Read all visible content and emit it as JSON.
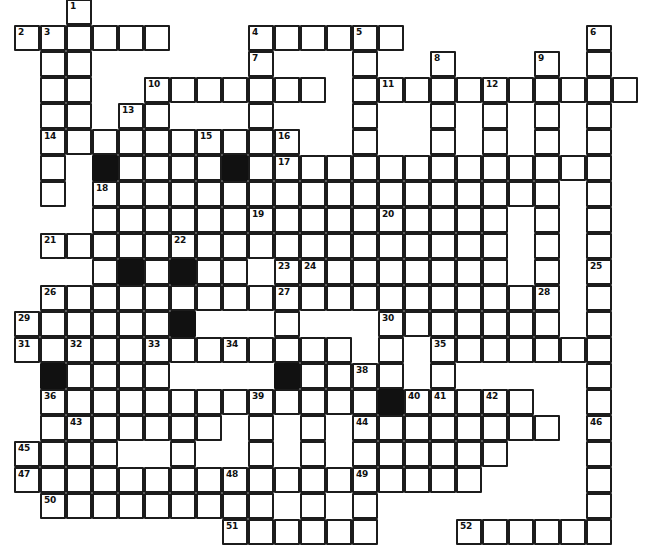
{
  "puzzle": {
    "title": "Crossword Puzzle Grid",
    "kind": "blank-crossword-grid",
    "style": "hand-drawn",
    "colors": {
      "paper": "#ffffff",
      "ink": "#1c1c1c",
      "block": "#111111",
      "number": "#101010"
    },
    "geometry": {
      "image_width": 645,
      "image_height": 530,
      "cell_size": 26,
      "origin_x": 14,
      "origin_y": -1,
      "columns": 24,
      "rows": 20
    },
    "counts": {
      "numbered_clues": 52,
      "blocked_cells": 9
    },
    "numbers": [
      1,
      2,
      3,
      4,
      5,
      6,
      7,
      8,
      9,
      10,
      11,
      12,
      13,
      14,
      15,
      16,
      17,
      18,
      19,
      20,
      21,
      22,
      23,
      24,
      25,
      26,
      27,
      28,
      29,
      30,
      31,
      32,
      33,
      34,
      35,
      36,
      37,
      38,
      39,
      40,
      41,
      42,
      43,
      44,
      45,
      46,
      47,
      48,
      49,
      50,
      51,
      52
    ],
    "cells": [
      {
        "c": 2,
        "r": 0,
        "n": "1"
      },
      {
        "c": 2,
        "r": 1
      },
      {
        "c": 0,
        "r": 1,
        "n": "2"
      },
      {
        "c": 1,
        "r": 1,
        "n": "3"
      },
      {
        "c": 3,
        "r": 1
      },
      {
        "c": 4,
        "r": 1
      },
      {
        "c": 5,
        "r": 1
      },
      {
        "c": 9,
        "r": 1,
        "n": "4"
      },
      {
        "c": 10,
        "r": 1
      },
      {
        "c": 11,
        "r": 1
      },
      {
        "c": 12,
        "r": 1
      },
      {
        "c": 13,
        "r": 1,
        "n": "5"
      },
      {
        "c": 14,
        "r": 1
      },
      {
        "c": 22,
        "r": 1,
        "n": "6"
      },
      {
        "c": 1,
        "r": 2
      },
      {
        "c": 2,
        "r": 2
      },
      {
        "c": 9,
        "r": 2,
        "n": "7"
      },
      {
        "c": 13,
        "r": 2
      },
      {
        "c": 16,
        "r": 2,
        "n": "8"
      },
      {
        "c": 20,
        "r": 2,
        "n": "9"
      },
      {
        "c": 22,
        "r": 2
      },
      {
        "c": 1,
        "r": 3
      },
      {
        "c": 2,
        "r": 3
      },
      {
        "c": 5,
        "r": 3,
        "n": "10"
      },
      {
        "c": 6,
        "r": 3
      },
      {
        "c": 7,
        "r": 3
      },
      {
        "c": 8,
        "r": 3
      },
      {
        "c": 9,
        "r": 3
      },
      {
        "c": 10,
        "r": 3
      },
      {
        "c": 11,
        "r": 3
      },
      {
        "c": 13,
        "r": 3
      },
      {
        "c": 14,
        "r": 3,
        "n": "11"
      },
      {
        "c": 15,
        "r": 3
      },
      {
        "c": 16,
        "r": 3
      },
      {
        "c": 17,
        "r": 3
      },
      {
        "c": 18,
        "r": 3,
        "n": "12"
      },
      {
        "c": 19,
        "r": 3
      },
      {
        "c": 20,
        "r": 3
      },
      {
        "c": 21,
        "r": 3
      },
      {
        "c": 22,
        "r": 3
      },
      {
        "c": 23,
        "r": 3
      },
      {
        "c": 1,
        "r": 4
      },
      {
        "c": 2,
        "r": 4
      },
      {
        "c": 4,
        "r": 4,
        "n": "13"
      },
      {
        "c": 5,
        "r": 4
      },
      {
        "c": 9,
        "r": 4
      },
      {
        "c": 13,
        "r": 4
      },
      {
        "c": 16,
        "r": 4
      },
      {
        "c": 18,
        "r": 4
      },
      {
        "c": 20,
        "r": 4
      },
      {
        "c": 22,
        "r": 4
      },
      {
        "c": 1,
        "r": 5,
        "n": "14"
      },
      {
        "c": 2,
        "r": 5
      },
      {
        "c": 3,
        "r": 5
      },
      {
        "c": 4,
        "r": 5
      },
      {
        "c": 5,
        "r": 5
      },
      {
        "c": 6,
        "r": 5
      },
      {
        "c": 7,
        "r": 5,
        "n": "15"
      },
      {
        "c": 8,
        "r": 5
      },
      {
        "c": 9,
        "r": 5
      },
      {
        "c": 10,
        "r": 5,
        "n": "16"
      },
      {
        "c": 13,
        "r": 5
      },
      {
        "c": 16,
        "r": 5
      },
      {
        "c": 18,
        "r": 5
      },
      {
        "c": 20,
        "r": 5
      },
      {
        "c": 22,
        "r": 5
      },
      {
        "c": 1,
        "r": 6
      },
      {
        "c": 3,
        "r": 6,
        "black": true
      },
      {
        "c": 4,
        "r": 6
      },
      {
        "c": 5,
        "r": 6
      },
      {
        "c": 6,
        "r": 6
      },
      {
        "c": 7,
        "r": 6
      },
      {
        "c": 8,
        "r": 6,
        "black": true
      },
      {
        "c": 9,
        "r": 6
      },
      {
        "c": 10,
        "r": 6,
        "n": "17"
      },
      {
        "c": 11,
        "r": 6
      },
      {
        "c": 12,
        "r": 6
      },
      {
        "c": 13,
        "r": 6
      },
      {
        "c": 14,
        "r": 6
      },
      {
        "c": 15,
        "r": 6
      },
      {
        "c": 16,
        "r": 6
      },
      {
        "c": 17,
        "r": 6
      },
      {
        "c": 18,
        "r": 6
      },
      {
        "c": 19,
        "r": 6
      },
      {
        "c": 20,
        "r": 6
      },
      {
        "c": 21,
        "r": 6
      },
      {
        "c": 22,
        "r": 6
      },
      {
        "c": 1,
        "r": 7
      },
      {
        "c": 3,
        "r": 7,
        "n": "18"
      },
      {
        "c": 4,
        "r": 7
      },
      {
        "c": 5,
        "r": 7
      },
      {
        "c": 6,
        "r": 7
      },
      {
        "c": 7,
        "r": 7
      },
      {
        "c": 8,
        "r": 7
      },
      {
        "c": 9,
        "r": 7
      },
      {
        "c": 10,
        "r": 7
      },
      {
        "c": 11,
        "r": 7
      },
      {
        "c": 12,
        "r": 7
      },
      {
        "c": 13,
        "r": 7
      },
      {
        "c": 14,
        "r": 7
      },
      {
        "c": 15,
        "r": 7
      },
      {
        "c": 16,
        "r": 7
      },
      {
        "c": 17,
        "r": 7
      },
      {
        "c": 18,
        "r": 7
      },
      {
        "c": 19,
        "r": 7
      },
      {
        "c": 20,
        "r": 7
      },
      {
        "c": 22,
        "r": 7
      },
      {
        "c": 3,
        "r": 8
      },
      {
        "c": 4,
        "r": 8
      },
      {
        "c": 5,
        "r": 8
      },
      {
        "c": 6,
        "r": 8
      },
      {
        "c": 7,
        "r": 8
      },
      {
        "c": 8,
        "r": 8
      },
      {
        "c": 9,
        "r": 8,
        "n": "19"
      },
      {
        "c": 10,
        "r": 8
      },
      {
        "c": 11,
        "r": 8
      },
      {
        "c": 12,
        "r": 8
      },
      {
        "c": 13,
        "r": 8
      },
      {
        "c": 14,
        "r": 8,
        "n": "20"
      },
      {
        "c": 15,
        "r": 8
      },
      {
        "c": 16,
        "r": 8
      },
      {
        "c": 17,
        "r": 8
      },
      {
        "c": 18,
        "r": 8
      },
      {
        "c": 20,
        "r": 8
      },
      {
        "c": 22,
        "r": 8
      },
      {
        "c": 1,
        "r": 9,
        "n": "21"
      },
      {
        "c": 2,
        "r": 9
      },
      {
        "c": 3,
        "r": 9
      },
      {
        "c": 4,
        "r": 9
      },
      {
        "c": 5,
        "r": 9
      },
      {
        "c": 6,
        "r": 9,
        "n": "22"
      },
      {
        "c": 7,
        "r": 9
      },
      {
        "c": 8,
        "r": 9
      },
      {
        "c": 9,
        "r": 9
      },
      {
        "c": 10,
        "r": 9
      },
      {
        "c": 11,
        "r": 9
      },
      {
        "c": 12,
        "r": 9
      },
      {
        "c": 13,
        "r": 9
      },
      {
        "c": 14,
        "r": 9
      },
      {
        "c": 15,
        "r": 9
      },
      {
        "c": 16,
        "r": 9
      },
      {
        "c": 17,
        "r": 9
      },
      {
        "c": 18,
        "r": 9
      },
      {
        "c": 20,
        "r": 9
      },
      {
        "c": 22,
        "r": 9
      },
      {
        "c": 3,
        "r": 10
      },
      {
        "c": 4,
        "r": 10,
        "black": true
      },
      {
        "c": 5,
        "r": 10
      },
      {
        "c": 6,
        "r": 10,
        "black": true
      },
      {
        "c": 7,
        "r": 10
      },
      {
        "c": 8,
        "r": 10
      },
      {
        "c": 10,
        "r": 10,
        "n": "23"
      },
      {
        "c": 11,
        "r": 10,
        "n": "24"
      },
      {
        "c": 12,
        "r": 10
      },
      {
        "c": 13,
        "r": 10
      },
      {
        "c": 14,
        "r": 10
      },
      {
        "c": 15,
        "r": 10
      },
      {
        "c": 16,
        "r": 10
      },
      {
        "c": 17,
        "r": 10
      },
      {
        "c": 18,
        "r": 10
      },
      {
        "c": 20,
        "r": 10
      },
      {
        "c": 22,
        "r": 10,
        "n": "25"
      },
      {
        "c": 1,
        "r": 11,
        "n": "26"
      },
      {
        "c": 2,
        "r": 11
      },
      {
        "c": 3,
        "r": 11
      },
      {
        "c": 4,
        "r": 11
      },
      {
        "c": 5,
        "r": 11
      },
      {
        "c": 6,
        "r": 11
      },
      {
        "c": 7,
        "r": 11
      },
      {
        "c": 8,
        "r": 11
      },
      {
        "c": 9,
        "r": 11
      },
      {
        "c": 10,
        "r": 11,
        "n": "27"
      },
      {
        "c": 11,
        "r": 11
      },
      {
        "c": 12,
        "r": 11
      },
      {
        "c": 13,
        "r": 11
      },
      {
        "c": 14,
        "r": 11
      },
      {
        "c": 15,
        "r": 11
      },
      {
        "c": 16,
        "r": 11
      },
      {
        "c": 17,
        "r": 11
      },
      {
        "c": 18,
        "r": 11
      },
      {
        "c": 19,
        "r": 11
      },
      {
        "c": 20,
        "r": 11,
        "n": "28"
      },
      {
        "c": 22,
        "r": 11
      },
      {
        "c": 0,
        "r": 12,
        "n": "29"
      },
      {
        "c": 1,
        "r": 12
      },
      {
        "c": 2,
        "r": 12
      },
      {
        "c": 3,
        "r": 12
      },
      {
        "c": 4,
        "r": 12
      },
      {
        "c": 5,
        "r": 12
      },
      {
        "c": 6,
        "r": 12,
        "black": true
      },
      {
        "c": 10,
        "r": 12
      },
      {
        "c": 14,
        "r": 12,
        "n": "30"
      },
      {
        "c": 15,
        "r": 12
      },
      {
        "c": 16,
        "r": 12
      },
      {
        "c": 17,
        "r": 12
      },
      {
        "c": 18,
        "r": 12
      },
      {
        "c": 19,
        "r": 12
      },
      {
        "c": 20,
        "r": 12
      },
      {
        "c": 22,
        "r": 12
      },
      {
        "c": 0,
        "r": 13,
        "n": "31"
      },
      {
        "c": 1,
        "r": 13
      },
      {
        "c": 2,
        "r": 13,
        "n": "32"
      },
      {
        "c": 3,
        "r": 13
      },
      {
        "c": 4,
        "r": 13
      },
      {
        "c": 5,
        "r": 13,
        "n": "33"
      },
      {
        "c": 6,
        "r": 13
      },
      {
        "c": 7,
        "r": 13
      },
      {
        "c": 8,
        "r": 13,
        "n": "34"
      },
      {
        "c": 9,
        "r": 13
      },
      {
        "c": 10,
        "r": 13
      },
      {
        "c": 11,
        "r": 13
      },
      {
        "c": 12,
        "r": 13
      },
      {
        "c": 14,
        "r": 13
      },
      {
        "c": 16,
        "r": 13,
        "n": "35"
      },
      {
        "c": 17,
        "r": 13
      },
      {
        "c": 18,
        "r": 13
      },
      {
        "c": 19,
        "r": 13
      },
      {
        "c": 20,
        "r": 13
      },
      {
        "c": 21,
        "r": 13
      },
      {
        "c": 22,
        "r": 13
      },
      {
        "c": 1,
        "r": 14,
        "black": true
      },
      {
        "c": 2,
        "r": 14
      },
      {
        "c": 3,
        "r": 14
      },
      {
        "c": 4,
        "r": 14
      },
      {
        "c": 5,
        "r": 14
      },
      {
        "c": 10,
        "r": 14,
        "black": true
      },
      {
        "c": 11,
        "r": 14
      },
      {
        "c": 12,
        "r": 14
      },
      {
        "c": 13,
        "r": 14,
        "n": "38"
      },
      {
        "c": 14,
        "r": 14
      },
      {
        "c": 16,
        "r": 14
      },
      {
        "c": 22,
        "r": 14
      },
      {
        "c": 1,
        "r": 15,
        "n": "36"
      },
      {
        "c": 2,
        "r": 15
      },
      {
        "c": 3,
        "r": 15
      },
      {
        "c": 4,
        "r": 15
      },
      {
        "c": 5,
        "r": 15
      },
      {
        "c": 6,
        "r": 15
      },
      {
        "c": 7,
        "r": 15
      },
      {
        "c": 8,
        "r": 15
      },
      {
        "c": 9,
        "r": 15,
        "n": "39"
      },
      {
        "c": 10,
        "r": 15
      },
      {
        "c": 11,
        "r": 15
      },
      {
        "c": 12,
        "r": 15
      },
      {
        "c": 13,
        "r": 15
      },
      {
        "c": 14,
        "r": 15,
        "black": true
      },
      {
        "c": 15,
        "r": 15,
        "n": "40"
      },
      {
        "c": 16,
        "r": 15,
        "n": "41"
      },
      {
        "c": 17,
        "r": 15
      },
      {
        "c": 18,
        "r": 15,
        "n": "42"
      },
      {
        "c": 19,
        "r": 15
      },
      {
        "c": 22,
        "r": 15
      },
      {
        "c": 1,
        "r": 16
      },
      {
        "c": 2,
        "r": 16,
        "n": "43"
      },
      {
        "c": 3,
        "r": 16
      },
      {
        "c": 4,
        "r": 16
      },
      {
        "c": 5,
        "r": 16
      },
      {
        "c": 6,
        "r": 16
      },
      {
        "c": 7,
        "r": 16
      },
      {
        "c": 9,
        "r": 16
      },
      {
        "c": 11,
        "r": 16
      },
      {
        "c": 13,
        "r": 16,
        "n": "44"
      },
      {
        "c": 14,
        "r": 16
      },
      {
        "c": 15,
        "r": 16
      },
      {
        "c": 16,
        "r": 16
      },
      {
        "c": 17,
        "r": 16
      },
      {
        "c": 18,
        "r": 16
      },
      {
        "c": 19,
        "r": 16
      },
      {
        "c": 20,
        "r": 16
      },
      {
        "c": 22,
        "r": 16,
        "n": "46"
      },
      {
        "c": 0,
        "r": 17,
        "n": "45"
      },
      {
        "c": 1,
        "r": 17
      },
      {
        "c": 2,
        "r": 17
      },
      {
        "c": 3,
        "r": 17
      },
      {
        "c": 6,
        "r": 17
      },
      {
        "c": 9,
        "r": 17
      },
      {
        "c": 11,
        "r": 17
      },
      {
        "c": 13,
        "r": 17
      },
      {
        "c": 14,
        "r": 17
      },
      {
        "c": 15,
        "r": 17
      },
      {
        "c": 16,
        "r": 17
      },
      {
        "c": 17,
        "r": 17
      },
      {
        "c": 18,
        "r": 17
      },
      {
        "c": 22,
        "r": 17
      },
      {
        "c": 0,
        "r": 18,
        "n": "47"
      },
      {
        "c": 1,
        "r": 18
      },
      {
        "c": 2,
        "r": 18
      },
      {
        "c": 3,
        "r": 18
      },
      {
        "c": 4,
        "r": 18
      },
      {
        "c": 5,
        "r": 18
      },
      {
        "c": 6,
        "r": 18
      },
      {
        "c": 7,
        "r": 18
      },
      {
        "c": 8,
        "r": 18,
        "n": "48"
      },
      {
        "c": 9,
        "r": 18
      },
      {
        "c": 10,
        "r": 18
      },
      {
        "c": 11,
        "r": 18
      },
      {
        "c": 12,
        "r": 18
      },
      {
        "c": 13,
        "r": 18,
        "n": "49"
      },
      {
        "c": 14,
        "r": 18
      },
      {
        "c": 15,
        "r": 18
      },
      {
        "c": 16,
        "r": 18
      },
      {
        "c": 17,
        "r": 18
      },
      {
        "c": 22,
        "r": 18
      },
      {
        "c": 1,
        "r": 19,
        "n": "50"
      },
      {
        "c": 2,
        "r": 19
      },
      {
        "c": 3,
        "r": 19
      },
      {
        "c": 4,
        "r": 19
      },
      {
        "c": 5,
        "r": 19
      },
      {
        "c": 6,
        "r": 19
      },
      {
        "c": 7,
        "r": 19
      },
      {
        "c": 8,
        "r": 19
      },
      {
        "c": 9,
        "r": 19
      },
      {
        "c": 11,
        "r": 19
      },
      {
        "c": 13,
        "r": 19
      },
      {
        "c": 22,
        "r": 19
      },
      {
        "c": 8,
        "r": 20,
        "n": "51"
      },
      {
        "c": 9,
        "r": 20
      },
      {
        "c": 10,
        "r": 20
      },
      {
        "c": 11,
        "r": 20
      },
      {
        "c": 12,
        "r": 20
      },
      {
        "c": 13,
        "r": 20
      },
      {
        "c": 17,
        "r": 20,
        "n": "52"
      },
      {
        "c": 18,
        "r": 20
      },
      {
        "c": 19,
        "r": 20
      },
      {
        "c": 20,
        "r": 20
      },
      {
        "c": 21,
        "r": 20
      },
      {
        "c": 22,
        "r": 20
      }
    ]
  }
}
